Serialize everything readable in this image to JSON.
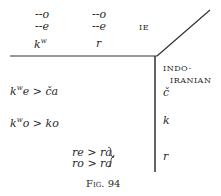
{
  "figure": {
    "caption": "Fig. 94",
    "regions": {
      "ie": {
        "label": "IE",
        "col1": {
          "line1": "--o",
          "line2": "--e",
          "base": "k",
          "base_sup": "w"
        },
        "col2": {
          "line1": "--o",
          "line2": "--e",
          "base": "r"
        }
      },
      "indo_iranian": {
        "label_line1": "INDO-",
        "label_line2": "IRANIAN",
        "outcomes": [
          "č",
          "k",
          "r"
        ]
      }
    },
    "rules": [
      {
        "lhs": "k",
        "lhs_sup": "w",
        "lhs_tail": "e > ča"
      },
      {
        "lhs": "k",
        "lhs_sup": "w",
        "lhs_tail": "o > ko"
      },
      {
        "line1": "re > ra,",
        "line2": "ro > ra"
      }
    ]
  }
}
